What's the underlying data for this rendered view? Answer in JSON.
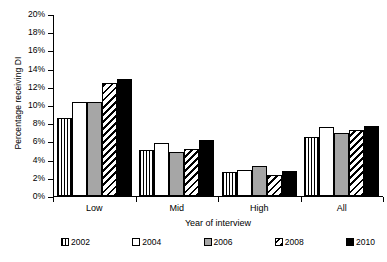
{
  "chart_data": {
    "type": "bar",
    "title": "",
    "xlabel": "Year of interview",
    "ylabel": "Percentage receiving DI",
    "categories": [
      "Low",
      "Mid",
      "High",
      "All"
    ],
    "ylim": [
      0,
      20
    ],
    "ytick_labels": [
      "0%",
      "2%",
      "4%",
      "6%",
      "8%",
      "10%",
      "12%",
      "14%",
      "16%",
      "18%",
      "20%"
    ],
    "ytick_values": [
      0,
      2,
      4,
      6,
      8,
      10,
      12,
      14,
      16,
      18,
      20
    ],
    "grid": false,
    "legend_position": "bottom",
    "value_unit": "%",
    "series": [
      {
        "name": "2002",
        "fill": "vertical-stripes",
        "color": "#ffffff",
        "values": [
          8.6,
          5.05,
          2.6,
          6.45
        ]
      },
      {
        "name": "2004",
        "fill": "solid-white",
        "color": "#ffffff",
        "values": [
          10.35,
          5.85,
          2.85,
          7.55
        ]
      },
      {
        "name": "2006",
        "fill": "solid-gray",
        "color": "#a6a6a6",
        "values": [
          10.3,
          4.85,
          3.25,
          6.9
        ]
      },
      {
        "name": "2008",
        "fill": "diagonal-hatch",
        "color": "#ffffff",
        "values": [
          12.4,
          5.2,
          2.3,
          7.2
        ]
      },
      {
        "name": "2010",
        "fill": "solid-black",
        "color": "#000000",
        "values": [
          12.85,
          6.2,
          2.7,
          7.65
        ]
      }
    ]
  }
}
